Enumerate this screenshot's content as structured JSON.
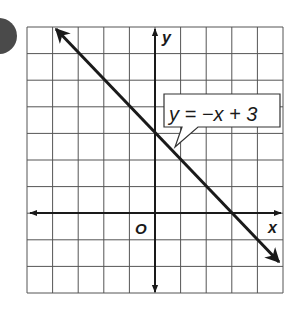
{
  "chart_data": {
    "type": "line",
    "title": "",
    "xlabel": "x",
    "ylabel": "y",
    "origin_label": "O",
    "xlim": [
      -5,
      5
    ],
    "ylim": [
      -3,
      7
    ],
    "grid": true,
    "series": [
      {
        "name": "y = −x + 3",
        "equation": "y = -x + 3",
        "slope": -1,
        "intercept": 3,
        "x": [
          -4,
          5
        ],
        "y": [
          7,
          -2
        ]
      }
    ],
    "annotations": [
      {
        "text": "y = −x + 3",
        "points_to": [
          0.7,
          2.3
        ]
      }
    ]
  },
  "labels": {
    "x_axis": "x",
    "y_axis": "y",
    "origin": "O",
    "equation": "y = −x + 3"
  },
  "colors": {
    "grid": "#555555",
    "line": "#1a1a1a",
    "badge": "#4a4a4a"
  }
}
